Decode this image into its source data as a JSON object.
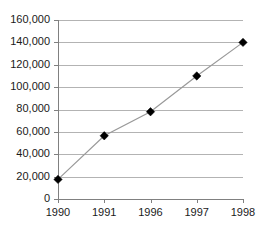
{
  "chart_data": {
    "type": "line",
    "title": "",
    "subtitle": "",
    "xlabel": "",
    "ylabel": "",
    "categories": [
      "1990",
      "1991",
      "1996",
      "1997",
      "1998"
    ],
    "values": [
      17500,
      56500,
      78000,
      110000,
      140000
    ],
    "series": [
      {
        "name": "",
        "values": [
          17500,
          56500,
          78000,
          110000,
          140000
        ]
      }
    ],
    "ylim": [
      0,
      160000
    ],
    "ytick_values": [
      0,
      20000,
      40000,
      60000,
      80000,
      100000,
      120000,
      140000,
      160000
    ],
    "ytick_labels": [
      "0",
      "20,000",
      "40,000",
      "60,000",
      "80,000",
      "100,000",
      "120,000",
      "140,000",
      "160,000"
    ],
    "xtick_labels": [
      "1990",
      "1991",
      "1996",
      "1997",
      "1998"
    ],
    "grid": true,
    "grid_axis": "y",
    "legend": false,
    "legend_position": "none",
    "marker": "diamond",
    "annotations": []
  },
  "style": {
    "background": "#ffffff",
    "gridline_color": "#b3b3b3",
    "axis_color": "#808080",
    "line_color": "#999999",
    "marker_color": "#000000",
    "label_color": "#1a1a1a"
  },
  "geometry": {
    "plot_left": 58,
    "plot_right": 243,
    "plot_top": 20,
    "plot_bottom": 199
  }
}
